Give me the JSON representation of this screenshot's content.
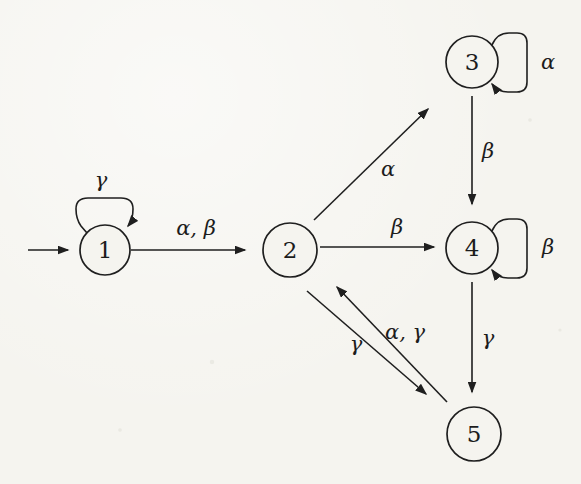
{
  "colors": {
    "paper": "#f5f4ef",
    "ink": "#1f1f1f"
  },
  "diagram": {
    "type": "state-transition-diagram",
    "states": [
      {
        "id": "1",
        "label": "1"
      },
      {
        "id": "2",
        "label": "2"
      },
      {
        "id": "3",
        "label": "3"
      },
      {
        "id": "4",
        "label": "4"
      },
      {
        "id": "5",
        "label": "5"
      }
    ],
    "transitions": [
      {
        "from": "start",
        "to": "1",
        "label": ""
      },
      {
        "from": "1",
        "to": "1",
        "label": "γ"
      },
      {
        "from": "1",
        "to": "2",
        "label": "α, β"
      },
      {
        "from": "2",
        "to": "3",
        "label": "α"
      },
      {
        "from": "2",
        "to": "4",
        "label": "β"
      },
      {
        "from": "3",
        "to": "3",
        "label": "α"
      },
      {
        "from": "3",
        "to": "4",
        "label": "β"
      },
      {
        "from": "4",
        "to": "4",
        "label": "β"
      },
      {
        "from": "4",
        "to": "5",
        "label": "γ"
      },
      {
        "from": "2",
        "to": "5",
        "label": "γ"
      },
      {
        "from": "5",
        "to": "2",
        "label": "α, γ"
      }
    ]
  }
}
